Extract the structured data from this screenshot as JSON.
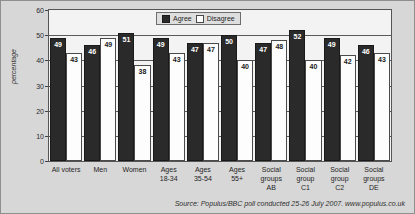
{
  "chart_data": {
    "type": "bar",
    "title": "",
    "xlabel": "",
    "ylabel": "percentage",
    "ylim": [
      0,
      60
    ],
    "yticks": [
      0,
      10,
      20,
      30,
      40,
      50,
      60
    ],
    "grid": true,
    "legend_position": "top-center",
    "categories": [
      "All voters",
      "Men",
      "Women",
      "Ages 18-34",
      "Ages 35-54",
      "Ages 55+",
      "Social groups AB",
      "Social group C1",
      "Social group C2",
      "Social groups DE"
    ],
    "category_lines": [
      [
        "All voters"
      ],
      [
        "Men"
      ],
      [
        "Women"
      ],
      [
        "Ages",
        "18-34"
      ],
      [
        "Ages",
        "35-54"
      ],
      [
        "Ages",
        "55+"
      ],
      [
        "Social",
        "groups",
        "AB"
      ],
      [
        "Social",
        "group",
        "C1"
      ],
      [
        "Social",
        "group",
        "C2"
      ],
      [
        "Social",
        "groups",
        "DE"
      ]
    ],
    "series": [
      {
        "name": "Agree",
        "color": "#2a2a2a",
        "values": [
          49,
          46,
          51,
          49,
          47,
          50,
          47,
          52,
          49,
          46
        ]
      },
      {
        "name": "Disagree",
        "color": "#ffffff",
        "values": [
          43,
          49,
          38,
          43,
          47,
          40,
          48,
          40,
          42,
          43
        ]
      }
    ],
    "annotation": "Source: Populus/BBC poll conducted 25-26 July 2007. www.populus.co.uk"
  },
  "legend": {
    "items": [
      {
        "label": "Agree",
        "swatch": "filled-dark-square"
      },
      {
        "label": "Disagree",
        "swatch": "outlined-white-square"
      }
    ]
  },
  "axes": {
    "y_title": "percentage",
    "y_tick_labels": [
      "60",
      "50",
      "40",
      "30",
      "20",
      "10",
      "0"
    ]
  },
  "source": {
    "text": "Source: Populus/BBC poll conducted 25-26 July 2007. www.populus.co.uk"
  },
  "colors": {
    "background": "#d7d7d7",
    "plot_background": "#f3f3f3",
    "agree": "#2a2a2a",
    "disagree": "#ffffff",
    "frame": "#555555"
  }
}
